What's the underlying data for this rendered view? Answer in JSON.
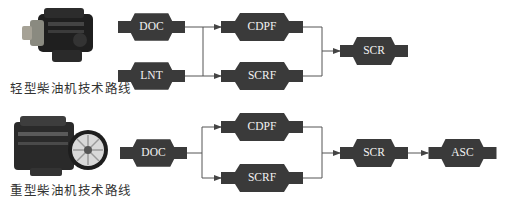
{
  "light_duty": {
    "caption": "轻型柴油机技术路线",
    "engine_image": "light-duty-diesel-engine-photo",
    "stage1": [
      "DOC",
      "LNT"
    ],
    "stage2": [
      "CDPF",
      "SCRF"
    ],
    "stage3": [
      "SCR"
    ]
  },
  "heavy_duty": {
    "caption": "重型柴油机技术路线",
    "engine_image": "heavy-duty-diesel-engine-photo",
    "stage1": [
      "DOC"
    ],
    "stage2": [
      "CDPF",
      "SCRF"
    ],
    "stage3": [
      "SCR"
    ],
    "stage4": [
      "ASC"
    ]
  },
  "colors": {
    "node_fill": "#3a3a3a",
    "node_text": "#f2f2f2",
    "connector": "#555555",
    "background": "#ffffff"
  }
}
